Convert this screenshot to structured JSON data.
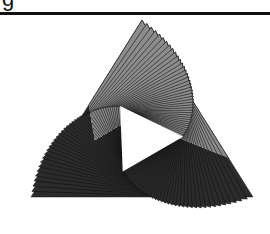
{
  "caption_fragment": "g",
  "figure": {
    "type": "spiral-of-rotated-triangles",
    "center": [
      142,
      128
    ],
    "outer_radius": 128,
    "initial_rotation_deg": -90,
    "count": 40,
    "rotation_step_deg": 2.2,
    "scale_step": 0.972,
    "colors": {
      "dark": "#2b2b2b",
      "light": "#8c8c8c",
      "stroke": "#111111",
      "hole": "#ffffff",
      "rule": "#111111"
    }
  }
}
